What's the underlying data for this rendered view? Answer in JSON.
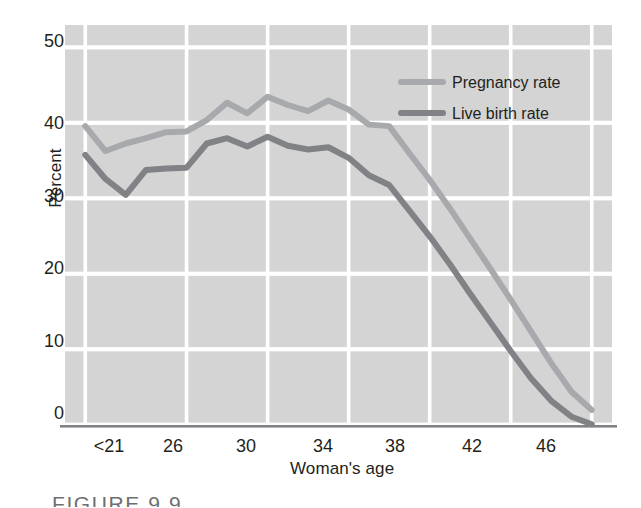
{
  "figure": {
    "caption": "FIGURE 9.9",
    "ylabel": "Percent",
    "xlabel": "Woman's age",
    "background": "#ffffff",
    "plot_fill": "#d4d4d4",
    "gridline_color": "#ffffff",
    "axis_color": "#808285",
    "text_color": "#231f20"
  },
  "legend": {
    "items": [
      {
        "label": "Pregnancy rate",
        "color": "#a7a9ac"
      },
      {
        "label": "Live birth rate",
        "color": "#808285"
      }
    ]
  },
  "chart_data": {
    "type": "line",
    "title": "",
    "xlabel": "Woman's age",
    "ylabel": "Percent",
    "xlim": [
      20,
      47
    ],
    "ylim": [
      0,
      53
    ],
    "yticks": [
      0,
      10,
      20,
      30,
      40,
      50
    ],
    "xticks": [
      21,
      26,
      30,
      34,
      38,
      42,
      46
    ],
    "xticklabels": [
      "<21",
      "26",
      "30",
      "34",
      "38",
      "42",
      "46"
    ],
    "grid": true,
    "legend_position": "top-right",
    "x": [
      21,
      22,
      23,
      24,
      25,
      26,
      27,
      28,
      29,
      30,
      31,
      32,
      33,
      34,
      35,
      36,
      37,
      38,
      39,
      40,
      41,
      42,
      43,
      44,
      45,
      46
    ],
    "series": [
      {
        "name": "Pregnancy rate",
        "color": "#a7a9ac",
        "values": [
          39.6,
          36.3,
          37.3,
          38.0,
          38.8,
          38.9,
          40.4,
          42.7,
          41.3,
          43.5,
          42.4,
          41.6,
          43.0,
          41.8,
          39.8,
          39.6,
          36.0,
          32.5,
          28.7,
          24.7,
          20.7,
          16.6,
          12.4,
          8.2,
          4.4,
          2.0
        ]
      },
      {
        "name": "Live birth rate",
        "color": "#808285",
        "values": [
          35.8,
          32.6,
          30.5,
          33.8,
          34.0,
          34.1,
          37.3,
          38.0,
          36.9,
          38.2,
          37.0,
          36.5,
          36.8,
          35.4,
          33.1,
          31.8,
          28.4,
          25.0,
          21.3,
          17.4,
          13.6,
          9.8,
          6.2,
          3.2,
          1.1,
          0.1
        ]
      }
    ]
  },
  "axes_geometry": {
    "plot_left": 65,
    "plot_right": 612,
    "plot_top": 25,
    "plot_bottom": 425
  }
}
